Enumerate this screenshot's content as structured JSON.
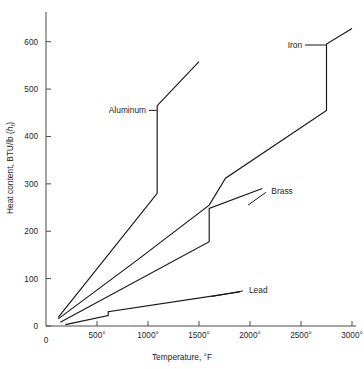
{
  "chart_data": {
    "type": "line",
    "title": "",
    "xlabel": "Temperature, °F",
    "ylabel": "Heat content, BTU/lb (h )",
    "ylabel_main": "Heat content, BTU/lb (",
    "ylabel_italic": "h",
    "ylabel_subscript": "f",
    "ylabel_close": ")",
    "xlim": [
      0,
      3000
    ],
    "ylim": [
      0,
      650
    ],
    "grid": false,
    "legend_position": "inline-annotations",
    "xticks": [
      0,
      500,
      1000,
      1500,
      2000,
      2500,
      3000
    ],
    "xticklabels": [
      "0",
      "500°",
      "1000°",
      "1500°",
      "2000°",
      "2500°",
      "3000°"
    ],
    "yticks": [
      0,
      100,
      200,
      300,
      400,
      500,
      600
    ],
    "yticklabels": [
      "0",
      "100",
      "200",
      "300",
      "400",
      "500",
      "600"
    ],
    "series": [
      {
        "name": "Aluminum",
        "color": "#16161a",
        "points": [
          [
            120,
            18
          ],
          [
            1090,
            280
          ],
          [
            1090,
            465
          ],
          [
            1500,
            558
          ]
        ]
      },
      {
        "name": "Iron",
        "color": "#16161a",
        "points": [
          [
            120,
            15
          ],
          [
            900,
            140
          ],
          [
            1600,
            255
          ],
          [
            1760,
            312
          ],
          [
            2750,
            455
          ],
          [
            2750,
            595
          ],
          [
            3000,
            628
          ]
        ]
      },
      {
        "name": "Brass",
        "color": "#16161a",
        "points": [
          [
            140,
            8
          ],
          [
            1600,
            178
          ],
          [
            1600,
            248
          ],
          [
            2120,
            290
          ]
        ]
      },
      {
        "name": "Lead",
        "color": "#16161a",
        "points": [
          [
            190,
            3
          ],
          [
            610,
            22
          ],
          [
            610,
            30
          ],
          [
            1900,
            72
          ]
        ]
      }
    ],
    "annotations": [
      {
        "name": "Aluminum",
        "label": "Aluminum",
        "label_x": 1010,
        "label_y": 455,
        "leader_from": [
          1010,
          455
        ],
        "leader_to": [
          1085,
          455
        ]
      },
      {
        "name": "Iron",
        "label": "Iron",
        "label_x": 2540,
        "label_y": 593,
        "leader_from": [
          2540,
          593
        ],
        "leader_to": [
          2745,
          593
        ]
      },
      {
        "name": "Brass",
        "label": "Brass",
        "label_x": 2180,
        "label_y": 285,
        "leader_from": [
          2155,
          282
        ],
        "leader_to": [
          1980,
          255
        ]
      },
      {
        "name": "Lead",
        "label": "Lead",
        "label_x": 1960,
        "label_y": 76,
        "leader_from": [
          1930,
          74
        ],
        "leader_to": [
          1620,
          62
        ]
      }
    ]
  },
  "axis": {
    "x_label": "Temperature, °F",
    "y_label_prefix": "Heat content, BTU/lb (",
    "y_label_symbol": "h",
    "y_label_sub": "f",
    "y_label_suffix": ")",
    "origin_label": "0"
  },
  "colors": {
    "curve": "#16161a",
    "axis": "#4a4a4a",
    "text": "#1d1d1d",
    "background": "#ffffff"
  }
}
